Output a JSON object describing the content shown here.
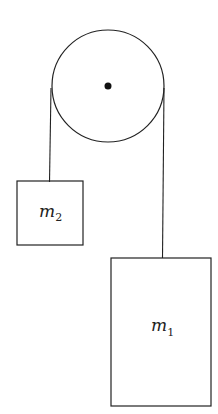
{
  "diagram": {
    "pulley": {
      "label": "pulley"
    },
    "masses": [
      {
        "id": "m2",
        "symbol": "m",
        "subscript": "2"
      },
      {
        "id": "m1",
        "symbol": "m",
        "subscript": "1"
      }
    ],
    "colors": {
      "stroke": "#222222",
      "background": "#ffffff"
    }
  }
}
